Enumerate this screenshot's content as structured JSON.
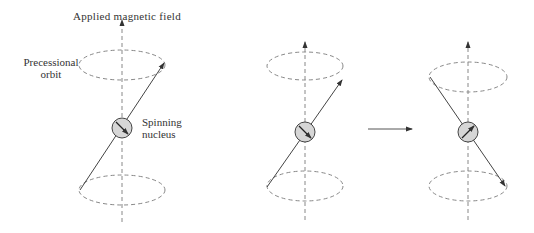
{
  "labels": {
    "field": "Applied magnetic field",
    "orbit_line1": "Precessional",
    "orbit_line2": "orbit",
    "nucleus_line1": "Spinning",
    "nucleus_line2": "nucleus"
  },
  "colors": {
    "line": "#444444",
    "dashed": "#888888",
    "nucleus_fill": "#d6d6d6",
    "text": "#333333"
  },
  "panels": [
    {
      "id": "left",
      "axis_x": 122,
      "state": "spin aligned with field, precessing"
    },
    {
      "id": "middle",
      "axis_x": 305,
      "state": "before transition"
    },
    {
      "id": "right",
      "axis_x": 468,
      "state": "after transition (flipped)"
    }
  ],
  "transition_arrow": "right"
}
